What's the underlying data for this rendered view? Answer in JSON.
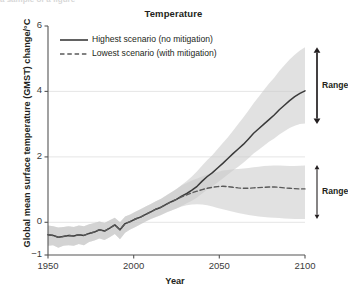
{
  "figure": {
    "cut_off_top_text": "a sample of a figure"
  },
  "chart_data": {
    "type": "line",
    "title": "Temperature",
    "xlabel": "Year",
    "ylabel": "Global mean surface temperature (GMST) change/°C",
    "xlim": [
      1950,
      2100
    ],
    "ylim": [
      -1,
      6
    ],
    "xticks": [
      1950,
      2000,
      2050,
      2100
    ],
    "xtick_labels": [
      "1950",
      "2000",
      "2050",
      "2100"
    ],
    "yticks": [
      -1,
      0,
      2,
      4,
      6
    ],
    "ytick_labels": [
      "−1",
      "0",
      "2",
      "4",
      "6"
    ],
    "gridlines": {
      "y": [
        0,
        2,
        4
      ],
      "x": []
    },
    "legend": {
      "position": "upper-left",
      "entries": [
        {
          "key": "highest",
          "label": "Highest scenario (no mitigation)",
          "style": "solid",
          "color": "#3a3a3a"
        },
        {
          "key": "lowest",
          "label": "Lowest scenario (with mitigation)",
          "style": "dashed",
          "color": "#5a5a5a"
        }
      ]
    },
    "band_color": "#c9c9c9",
    "band_opacity": 0.55,
    "annotations": [
      {
        "key": "range-high",
        "label": "Range",
        "x": 2100,
        "y_top": 5.35,
        "y_bottom": 3.0,
        "arrow": "double",
        "weight": "thick"
      },
      {
        "key": "range-low",
        "label": "Range",
        "x": 2100,
        "y_top": 1.75,
        "y_bottom": 0.1,
        "arrow": "double",
        "weight": "thin"
      }
    ],
    "x": [
      1950,
      1953,
      1956,
      1959,
      1962,
      1965,
      1968,
      1971,
      1974,
      1977,
      1980,
      1983,
      1986,
      1989,
      1992,
      1995,
      1998,
      2001,
      2004,
      2007,
      2010,
      2013,
      2016,
      2019,
      2022,
      2025,
      2028,
      2031,
      2034,
      2037,
      2040,
      2043,
      2046,
      2049,
      2052,
      2055,
      2058,
      2061,
      2064,
      2067,
      2070,
      2073,
      2076,
      2079,
      2082,
      2085,
      2088,
      2091,
      2094,
      2097,
      2100
    ],
    "series": [
      {
        "name": "Highest scenario (no mitigation)",
        "key": "highest",
        "style": "solid",
        "values": [
          -0.38,
          -0.4,
          -0.46,
          -0.43,
          -0.4,
          -0.42,
          -0.38,
          -0.4,
          -0.34,
          -0.3,
          -0.23,
          -0.27,
          -0.18,
          -0.08,
          -0.23,
          -0.04,
          0.02,
          0.1,
          0.16,
          0.24,
          0.32,
          0.4,
          0.46,
          0.55,
          0.63,
          0.7,
          0.8,
          0.88,
          0.98,
          1.1,
          1.26,
          1.4,
          1.52,
          1.66,
          1.8,
          1.95,
          2.1,
          2.24,
          2.38,
          2.55,
          2.72,
          2.86,
          3.0,
          3.14,
          3.28,
          3.44,
          3.58,
          3.72,
          3.84,
          3.94,
          4.02
        ],
        "band_low": [
          -0.72,
          -0.7,
          -0.78,
          -0.72,
          -0.7,
          -0.72,
          -0.66,
          -0.7,
          -0.6,
          -0.56,
          -0.5,
          -0.54,
          -0.46,
          -0.36,
          -0.52,
          -0.32,
          -0.22,
          -0.14,
          -0.06,
          0.02,
          0.1,
          0.16,
          0.22,
          0.3,
          0.36,
          0.42,
          0.5,
          0.58,
          0.66,
          0.76,
          0.88,
          1.0,
          1.1,
          1.22,
          1.34,
          1.46,
          1.58,
          1.7,
          1.82,
          1.96,
          2.1,
          2.22,
          2.34,
          2.46,
          2.56,
          2.68,
          2.78,
          2.88,
          2.95,
          3.0,
          3.02
        ],
        "band_high": [
          -0.1,
          -0.12,
          -0.16,
          -0.14,
          -0.12,
          -0.14,
          -0.1,
          -0.12,
          -0.06,
          -0.02,
          0.02,
          -0.02,
          0.06,
          0.14,
          0.0,
          0.18,
          0.24,
          0.32,
          0.4,
          0.48,
          0.56,
          0.64,
          0.72,
          0.82,
          0.92,
          1.02,
          1.14,
          1.26,
          1.4,
          1.56,
          1.74,
          1.9,
          2.06,
          2.24,
          2.42,
          2.6,
          2.8,
          3.0,
          3.2,
          3.42,
          3.64,
          3.84,
          4.04,
          4.24,
          4.42,
          4.62,
          4.8,
          4.98,
          5.12,
          5.25,
          5.35
        ]
      },
      {
        "name": "Lowest scenario (with mitigation)",
        "key": "lowest",
        "style": "dashed",
        "values": [
          -0.38,
          -0.4,
          -0.46,
          -0.43,
          -0.4,
          -0.42,
          -0.38,
          -0.4,
          -0.34,
          -0.3,
          -0.23,
          -0.27,
          -0.18,
          -0.08,
          -0.23,
          -0.04,
          0.02,
          0.1,
          0.16,
          0.24,
          0.32,
          0.4,
          0.46,
          0.55,
          0.63,
          0.7,
          0.78,
          0.84,
          0.9,
          0.95,
          1.0,
          1.04,
          1.07,
          1.09,
          1.1,
          1.09,
          1.07,
          1.05,
          1.04,
          1.04,
          1.05,
          1.06,
          1.07,
          1.08,
          1.08,
          1.07,
          1.05,
          1.04,
          1.03,
          1.02,
          1.02
        ],
        "band_low": [
          -0.72,
          -0.7,
          -0.78,
          -0.72,
          -0.7,
          -0.72,
          -0.66,
          -0.7,
          -0.6,
          -0.56,
          -0.5,
          -0.54,
          -0.46,
          -0.36,
          -0.52,
          -0.32,
          -0.22,
          -0.14,
          -0.06,
          0.02,
          0.1,
          0.16,
          0.22,
          0.3,
          0.36,
          0.42,
          0.48,
          0.52,
          0.54,
          0.55,
          0.54,
          0.52,
          0.48,
          0.44,
          0.4,
          0.36,
          0.32,
          0.28,
          0.25,
          0.22,
          0.2,
          0.18,
          0.16,
          0.15,
          0.14,
          0.13,
          0.12,
          0.11,
          0.1,
          0.1,
          0.1
        ],
        "band_high": [
          -0.1,
          -0.12,
          -0.16,
          -0.14,
          -0.12,
          -0.14,
          -0.1,
          -0.12,
          -0.06,
          -0.02,
          0.02,
          -0.02,
          0.06,
          0.14,
          0.0,
          0.18,
          0.24,
          0.32,
          0.4,
          0.48,
          0.56,
          0.64,
          0.72,
          0.82,
          0.92,
          1.02,
          1.12,
          1.2,
          1.28,
          1.34,
          1.4,
          1.46,
          1.5,
          1.54,
          1.58,
          1.6,
          1.62,
          1.63,
          1.64,
          1.66,
          1.68,
          1.7,
          1.72,
          1.73,
          1.74,
          1.74,
          1.73,
          1.72,
          1.72,
          1.73,
          1.74
        ]
      }
    ]
  }
}
